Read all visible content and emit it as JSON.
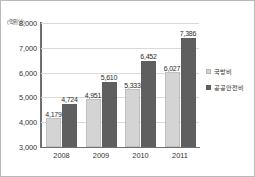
{
  "chart_data": {
    "type": "bar",
    "title": "",
    "xlabel": "",
    "ylabel": "",
    "unit_label": "(억위안)",
    "categories": [
      "2008",
      "2009",
      "2010",
      "2011"
    ],
    "series": [
      {
        "name": "국방비",
        "color": "#d4d4d4",
        "values": [
          4179,
          4951,
          5333,
          6027
        ],
        "labels": [
          "4,179",
          "4,951",
          "5,333",
          "6,027"
        ]
      },
      {
        "name": "공공안전비",
        "color": "#5f5f5f",
        "values": [
          4724,
          5610,
          6452,
          7386
        ],
        "labels": [
          "4,724",
          "5,610",
          "6,452",
          "7,386"
        ]
      }
    ],
    "ylim": [
      3000,
      8000
    ],
    "yticks": [
      3000,
      4000,
      5000,
      6000,
      7000,
      8000
    ],
    "ytick_labels": [
      "3,000",
      "4,000",
      "5,000",
      "6,000",
      "7,000",
      "8,000"
    ],
    "grid": true,
    "legend_position": "right"
  }
}
